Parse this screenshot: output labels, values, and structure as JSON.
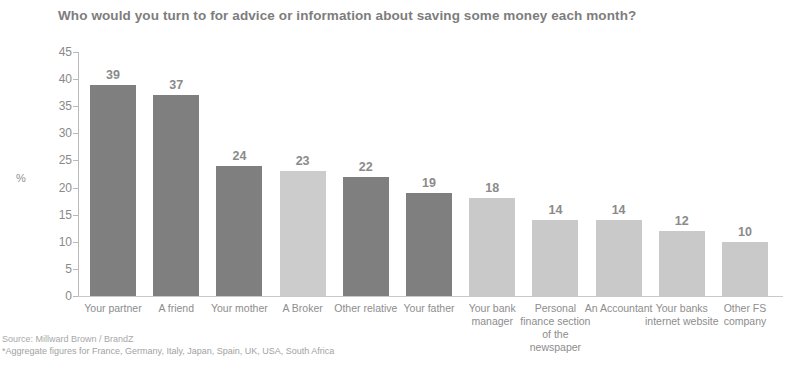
{
  "chart_data": {
    "type": "bar",
    "title": "Who would you turn to for advice or information about saving some money each month?",
    "xlabel": "",
    "ylabel": "%",
    "ylim": [
      0,
      45
    ],
    "yticks": [
      45,
      40,
      35,
      30,
      25,
      20,
      15,
      10,
      5,
      0
    ],
    "grid": false,
    "legend": "none",
    "categories": [
      "Your partner",
      "A friend",
      "Your mother",
      "A Broker",
      "Other relative",
      "Your father",
      "Your bank manager",
      "Personal finance section of the newspaper",
      "An Accountant",
      "Your banks internet website",
      "Other FS company"
    ],
    "values": [
      39,
      37,
      24,
      23,
      22,
      19,
      18,
      14,
      14,
      12,
      10
    ],
    "bar_colors": [
      "#7f7f7f",
      "#7f7f7f",
      "#7f7f7f",
      "#cccccc",
      "#7f7f7f",
      "#7f7f7f",
      "#c9c9c9",
      "#c9c9c9",
      "#c9c9c9",
      "#c9c9c9",
      "#c9c9c9"
    ],
    "annotations": [
      "Source: Millward Brown / BrandZ",
      "*Aggregate figures for France, Germany, Italy, Japan, Spain, UK, USA, South Africa"
    ]
  },
  "footnote": {
    "source": "Source: Millward Brown / BrandZ",
    "note": "*Aggregate figures for France, Germany, Italy, Japan, Spain, UK, USA, South Africa"
  },
  "colors": {
    "dark_bar": "#7f7f7f",
    "light_bar": "#c9c9c9",
    "text": "#8a8a8a",
    "axis": "#bbbbbb"
  }
}
